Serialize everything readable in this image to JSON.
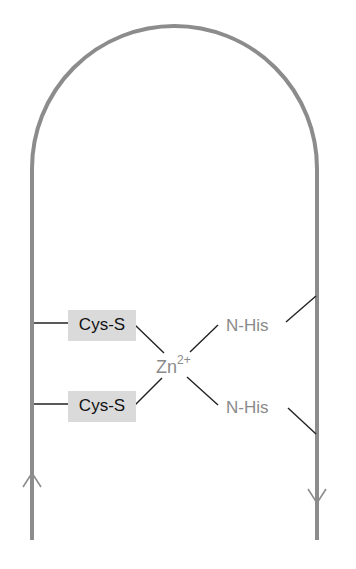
{
  "figure": {
    "type": "zinc-finger-motif",
    "colors": {
      "backbone": "#8c8c8c",
      "bond": "#222222",
      "cys_box": "#dadada",
      "cys_text": "#111111",
      "gray_text": "#8a8a8a"
    }
  },
  "labels": {
    "cys_top": "Cys-S",
    "cys_bottom": "Cys-S",
    "his_top": "N-His",
    "his_bottom": "N-His",
    "zinc": "Zn",
    "zinc_charge": "2+"
  },
  "arrows": {
    "left": "up",
    "right": "down"
  }
}
